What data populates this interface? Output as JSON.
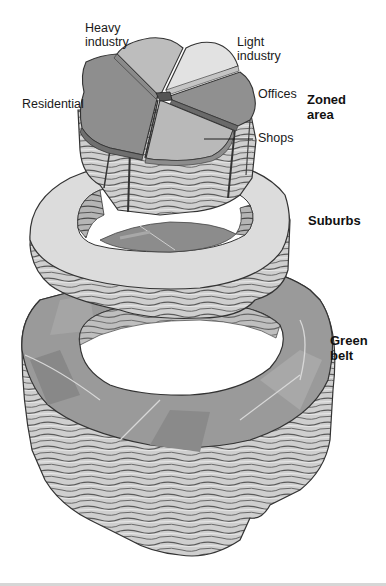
{
  "diagram": {
    "palette": {
      "background": "#ffffff",
      "residential": "#8e8e8e",
      "heavy_industry": "#bdbdbd",
      "light_industry": "#e0e0e0",
      "offices": "#909090",
      "shops": "#b8b8b8",
      "suburbs_top": "#dcdcdc",
      "green_belt_top": "#9a9a9a",
      "strata": "#c9c9c9",
      "strata_line": "#4a4a4a",
      "label_text": "#1a1a1a"
    },
    "tiers": [
      {
        "name": "Zoned area",
        "label": "Zoned area",
        "label_lines": [
          "Zoned",
          "area"
        ],
        "segments": [
          {
            "name": "Heavy industry",
            "label_lines": [
              "Heavy",
              "industry"
            ]
          },
          {
            "name": "Light industry",
            "label_lines": [
              "Light",
              "industry"
            ]
          },
          {
            "name": "Offices",
            "label_lines": [
              "Offices"
            ]
          },
          {
            "name": "Shops",
            "label_lines": [
              "Shops"
            ]
          },
          {
            "name": "Residential",
            "label_lines": [
              "Residential"
            ]
          }
        ]
      },
      {
        "name": "Suburbs",
        "label_lines": [
          "Suburbs"
        ]
      },
      {
        "name": "Green belt",
        "label_lines": [
          "Green",
          "belt"
        ]
      }
    ]
  }
}
